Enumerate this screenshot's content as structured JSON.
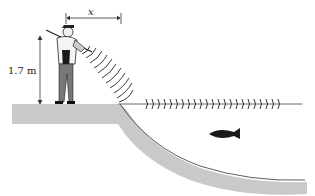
{
  "diagram": {
    "labels": {
      "height": "1.7 m",
      "distance": "x"
    },
    "elements": {
      "person": "fisherman holding rod with flashlight",
      "light_waves": "arcs emanating from light source toward shore",
      "refracted_waves": "waves traveling along water surface",
      "fish": "fish underwater",
      "bank": "ground and curved lake bed"
    },
    "colors": {
      "ground": "#c9c9c9",
      "ink": "#222222",
      "fish": "#1a1a1a",
      "background": "#ffffff"
    }
  }
}
